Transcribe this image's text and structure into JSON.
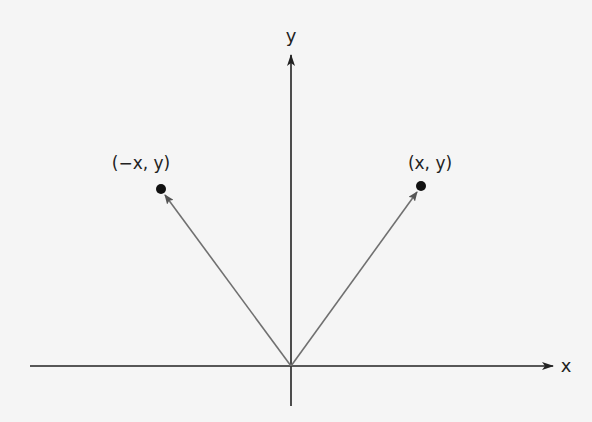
{
  "diagram": {
    "background": "#f5f5f5",
    "axis_color": "#222222",
    "vector_color": "#707070",
    "point_color": "#111111",
    "origin": {
      "x": 291,
      "y": 366
    },
    "axes": {
      "x_label": "x",
      "y_label": "y"
    },
    "points": [
      {
        "label": "(−x, y)",
        "px": 161,
        "py": 189
      },
      {
        "label": "(x, y)",
        "px": 421,
        "py": 186
      }
    ]
  }
}
